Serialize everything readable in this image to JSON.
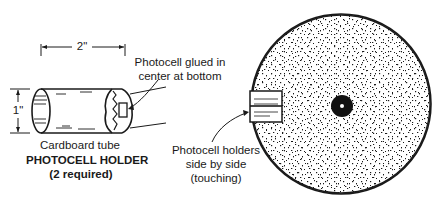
{
  "diagram": {
    "left_panel": {
      "dimension_width": "2\"",
      "dimension_height": "1\"",
      "tube_label": "Cardboard tube",
      "photocell_callout_line1": "Photocell glued in",
      "photocell_callout_line2": "center at bottom",
      "title": "PHOTOCELL HOLDER",
      "subtitle": "(2 required)"
    },
    "right_panel": {
      "callout_line1": "Photocell holders",
      "callout_line2": "side by side",
      "callout_line3": "(touching)"
    },
    "colors": {
      "ink": "#1a1a1a",
      "background": "#ffffff"
    }
  }
}
